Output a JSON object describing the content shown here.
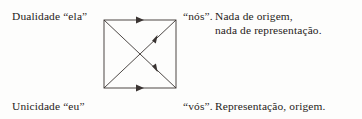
{
  "figure": {
    "type": "square-with-diagonals",
    "background_color": "#fdfdfc",
    "ink_color": "#3a3432",
    "labels": {
      "top_left": "Dualidade “ela”",
      "top_right": "“nós”.",
      "bottom_left": "Unicidade “eu”",
      "bottom_right": "“vós”."
    },
    "notes": {
      "top_line_1": "Nada de origem,",
      "top_line_2": "nada de representação.",
      "bottom_line_1": "Representação, origem."
    },
    "arrows": [
      {
        "name": "top-edge-arrow",
        "direction": "right",
        "position": "top edge midpoint"
      },
      {
        "name": "bottom-edge-arrow",
        "direction": "right",
        "position": "bottom edge midpoint"
      },
      {
        "name": "ascending-diagonal-arrow",
        "direction": "up-right",
        "position": "upper right quadrant"
      },
      {
        "name": "descending-diagonal-arrow",
        "direction": "down-right",
        "position": "lower right quadrant"
      }
    ]
  }
}
